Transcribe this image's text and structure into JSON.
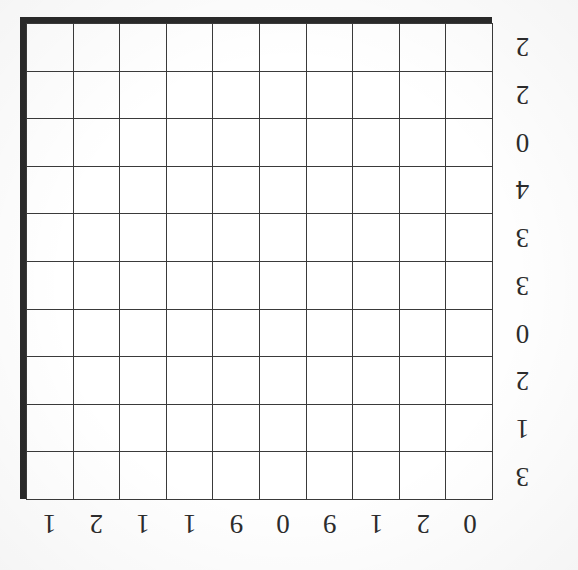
{
  "document": {
    "kind": "scanned-grid-puzzle",
    "orientation": "upside-down",
    "title": "Empty 10x10 grid puzzle"
  },
  "grid": {
    "columns": 10,
    "rows": 10,
    "cell_fill": "empty",
    "line_color": "#3a3a3a",
    "edge_shadow_color": "#2a2a2a",
    "background_color": "#ffffff"
  },
  "column_clues": [
    {
      "index": 1,
      "label": "0"
    },
    {
      "index": 2,
      "label": "2"
    },
    {
      "index": 3,
      "label": "1"
    },
    {
      "index": 4,
      "label": "9"
    },
    {
      "index": 5,
      "label": "0"
    },
    {
      "index": 6,
      "label": "9"
    },
    {
      "index": 7,
      "label": "1"
    },
    {
      "index": 8,
      "label": "1"
    },
    {
      "index": 9,
      "label": "2"
    },
    {
      "index": 10,
      "label": "1"
    }
  ],
  "row_clues": [
    {
      "index": 1,
      "label": "3"
    },
    {
      "index": 2,
      "label": "1"
    },
    {
      "index": 3,
      "label": "2"
    },
    {
      "index": 4,
      "label": "0"
    },
    {
      "index": 5,
      "label": "3"
    },
    {
      "index": 6,
      "label": "3"
    },
    {
      "index": 7,
      "label": "4"
    },
    {
      "index": 8,
      "label": "0"
    },
    {
      "index": 9,
      "label": "2"
    },
    {
      "index": 10,
      "label": "2"
    }
  ]
}
